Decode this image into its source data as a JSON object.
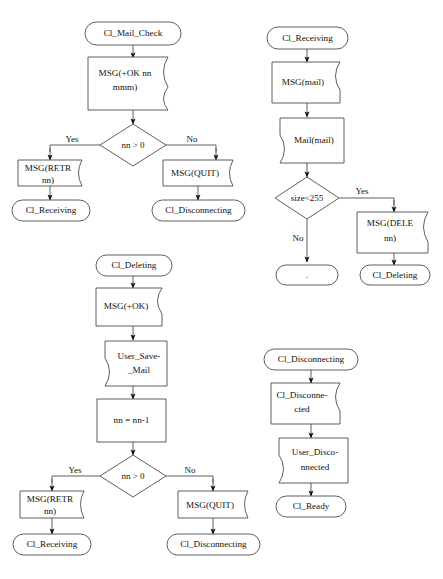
{
  "diagram": {
    "type": "flowchart",
    "colors": {
      "shape_stroke": "#4d4d4d",
      "shape_fill": "#ffffff",
      "text": "#111111",
      "connector": "#4d4d4d",
      "background": "#ffffff"
    },
    "sections": [
      {
        "id": "mail-check",
        "name": "Cl_Mail_Check flow",
        "nodes": [
          {
            "id": "mc-start",
            "shape": "terminal",
            "lines": [
              "Cl_Mail_Check"
            ]
          },
          {
            "id": "mc-msg-ok",
            "shape": "doc-right",
            "lines": [
              "MSG(+OK nn",
              "mmm)"
            ]
          },
          {
            "id": "mc-dec",
            "shape": "decision",
            "lines": [
              "nn > 0"
            ]
          },
          {
            "id": "mc-retr",
            "shape": "doc-right",
            "lines": [
              "MSG(RETR",
              "nn)"
            ]
          },
          {
            "id": "mc-quit",
            "shape": "doc-right",
            "lines": [
              "MSG(QUIT)"
            ]
          },
          {
            "id": "mc-recv",
            "shape": "terminal",
            "lines": [
              "Cl_Receiving"
            ]
          },
          {
            "id": "mc-disc",
            "shape": "terminal",
            "lines": [
              "Cl_Disconnecting"
            ]
          }
        ],
        "edge_labels": {
          "yes": "Yes",
          "no": "No"
        }
      },
      {
        "id": "receiving",
        "name": "Cl_Receiving flow",
        "nodes": [
          {
            "id": "rc-start",
            "shape": "terminal",
            "lines": [
              "Cl_Receiving"
            ]
          },
          {
            "id": "rc-msgmail",
            "shape": "doc-right",
            "lines": [
              "MSG(mail)"
            ]
          },
          {
            "id": "rc-mail",
            "shape": "doc-left",
            "lines": [
              "Mail(mail)"
            ]
          },
          {
            "id": "rc-dec",
            "shape": "decision",
            "lines": [
              "size<255"
            ]
          },
          {
            "id": "rc-dele",
            "shape": "doc-right",
            "lines": [
              "MSG(DELE",
              "nn)"
            ]
          },
          {
            "id": "rc-del",
            "shape": "terminal",
            "lines": [
              "Cl_Deleting"
            ]
          },
          {
            "id": "rc-end",
            "shape": "terminal",
            "lines": [
              "."
            ]
          }
        ],
        "edge_labels": {
          "yes": "Yes",
          "no": "No"
        }
      },
      {
        "id": "deleting",
        "name": "Cl_Deleting flow",
        "nodes": [
          {
            "id": "dl-start",
            "shape": "terminal",
            "lines": [
              "Cl_Deleting"
            ]
          },
          {
            "id": "dl-msgok",
            "shape": "doc-right",
            "lines": [
              "MSG(+OK)"
            ]
          },
          {
            "id": "dl-save",
            "shape": "doc-left",
            "lines": [
              "User_Save-",
              "_Mail"
            ]
          },
          {
            "id": "dl-dec-nn",
            "shape": "process",
            "lines": [
              "nn = nn-1"
            ]
          },
          {
            "id": "dl-dec",
            "shape": "decision",
            "lines": [
              "nn > 0"
            ]
          },
          {
            "id": "dl-retr",
            "shape": "doc-right",
            "lines": [
              "MSG(RETR",
              "nn)"
            ]
          },
          {
            "id": "dl-quit",
            "shape": "doc-right",
            "lines": [
              "MSG(QUIT)"
            ]
          },
          {
            "id": "dl-recv",
            "shape": "terminal",
            "lines": [
              "Cl_Receiving"
            ]
          },
          {
            "id": "dl-disc",
            "shape": "terminal",
            "lines": [
              "Cl_Disconnecting"
            ]
          }
        ],
        "edge_labels": {
          "yes": "Yes",
          "no": "No"
        }
      },
      {
        "id": "disconnecting",
        "name": "Cl_Disconnecting flow",
        "nodes": [
          {
            "id": "ds-start",
            "shape": "terminal",
            "lines": [
              "Cl_Disconnecting"
            ]
          },
          {
            "id": "ds-discd",
            "shape": "doc-right",
            "lines": [
              "Cl_Disconne-",
              "cted"
            ]
          },
          {
            "id": "ds-user",
            "shape": "doc-left",
            "lines": [
              "User_Disco-",
              "nnected"
            ]
          },
          {
            "id": "ds-ready",
            "shape": "terminal",
            "lines": [
              "Cl_Ready"
            ]
          }
        ],
        "edge_labels": {}
      }
    ]
  },
  "labels": {
    "mc_start": "Cl_Mail_Check",
    "mc_msg_ok_1": "MSG(+OK nn",
    "mc_msg_ok_2": "mmm)",
    "mc_dec": "nn > 0",
    "mc_yes": "Yes",
    "mc_no": "No",
    "mc_retr_1": "MSG(RETR",
    "mc_retr_2": "nn)",
    "mc_quit": "MSG(QUIT)",
    "mc_recv": "Cl_Receiving",
    "mc_disc": "Cl_Disconnecting",
    "rc_start": "Cl_Receiving",
    "rc_msgmail": "MSG(mail)",
    "rc_mail": "Mail(mail)",
    "rc_dec": "size<255",
    "rc_yes": "Yes",
    "rc_no": "No",
    "rc_dele_1": "MSG(DELE",
    "rc_dele_2": "nn)",
    "rc_del": "Cl_Deleting",
    "rc_end": ".",
    "dl_start": "Cl_Deleting",
    "dl_msgok": "MSG(+OK)",
    "dl_save_1": "User_Save-",
    "dl_save_2": "_Mail",
    "dl_nn": "nn = nn-1",
    "dl_dec": "nn > 0",
    "dl_yes": "Yes",
    "dl_no": "No",
    "dl_retr_1": "MSG(RETR",
    "dl_retr_2": "nn)",
    "dl_quit": "MSG(QUIT)",
    "dl_recv": "Cl_Receiving",
    "dl_disc": "Cl_Disconnecting",
    "ds_start": "Cl_Disconnecting",
    "ds_discd_1": "Cl_Disconne-",
    "ds_discd_2": "cted",
    "ds_user_1": "User_Disco-",
    "ds_user_2": "nnected",
    "ds_ready": "Cl_Ready"
  }
}
